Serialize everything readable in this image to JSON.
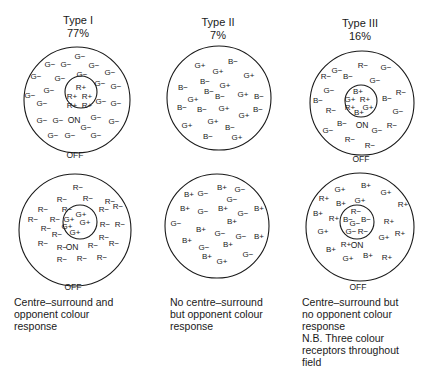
{
  "figure": {
    "columns": [
      {
        "id": "type1",
        "title": "Type I",
        "percent": "77%",
        "caption": "Centre–surround and\nopponent colour\nresponse",
        "top": {
          "outer": {
            "cx": 77,
            "cy": 100,
            "r": 53
          },
          "inner": {
            "cx": 81,
            "cy": 92,
            "r": 16
          },
          "off_label": {
            "text": "OFF",
            "x": 75,
            "y": 156
          },
          "on_label": {
            "text": "ON",
            "x": 74,
            "y": 121
          },
          "centre_labels": [
            {
              "t": "R+",
              "x": 81,
              "y": 88
            },
            {
              "t": "R+",
              "x": 72,
              "y": 97
            },
            {
              "t": "R+",
              "x": 87,
              "y": 97
            },
            {
              "t": "R+",
              "x": 72,
              "y": 106
            },
            {
              "t": "R+",
              "x": 87,
              "y": 106
            }
          ],
          "surround_labels": [
            {
              "t": "G−",
              "x": 80,
              "y": 57
            },
            {
              "t": "G−",
              "x": 50,
              "y": 65
            },
            {
              "t": "G−",
              "x": 66,
              "y": 65
            },
            {
              "t": "G−",
              "x": 94,
              "y": 66
            },
            {
              "t": "G−",
              "x": 36,
              "y": 77
            },
            {
              "t": "G−",
              "x": 60,
              "y": 79
            },
            {
              "t": "G−",
              "x": 82,
              "y": 75
            },
            {
              "t": "G−",
              "x": 110,
              "y": 73
            },
            {
              "t": "G−",
              "x": 100,
              "y": 84
            },
            {
              "t": "G−",
              "x": 116,
              "y": 87
            },
            {
              "t": "G−",
              "x": 30,
              "y": 96
            },
            {
              "t": "G−",
              "x": 49,
              "y": 91
            },
            {
              "t": "G−",
              "x": 42,
              "y": 104
            },
            {
              "t": "G−",
              "x": 101,
              "y": 102
            },
            {
              "t": "G−",
              "x": 116,
              "y": 104
            },
            {
              "t": "G−",
              "x": 42,
              "y": 121
            },
            {
              "t": "G−",
              "x": 58,
              "y": 121
            },
            {
              "t": "G−",
              "x": 96,
              "y": 118
            },
            {
              "t": "G−",
              "x": 114,
              "y": 122
            },
            {
              "t": "G−",
              "x": 86,
              "y": 128
            },
            {
              "t": "G−",
              "x": 53,
              "y": 136
            },
            {
              "t": "G−",
              "x": 70,
              "y": 136
            },
            {
              "t": "G−",
              "x": 96,
              "y": 136
            }
          ]
        },
        "bottom": {
          "outer": {
            "cx": 75,
            "cy": 230,
            "r": 56
          },
          "inner": {
            "cx": 80,
            "cy": 222,
            "r": 17
          },
          "off_label": {
            "text": "OFF",
            "x": 73,
            "y": 288
          },
          "on_label": {
            "text": "ON",
            "x": 72,
            "y": 248
          },
          "centre_labels": [
            {
              "t": "G+",
              "x": 81,
              "y": 215
            },
            {
              "t": "G+",
              "x": 69,
              "y": 220
            },
            {
              "t": "G+",
              "x": 85,
              "y": 223
            },
            {
              "t": "G+",
              "x": 67,
              "y": 227
            },
            {
              "t": "G+",
              "x": 75,
              "y": 233
            }
          ],
          "surround_labels": [
            {
              "t": "R−",
              "x": 78,
              "y": 188
            },
            {
              "t": "R−",
              "x": 62,
              "y": 200
            },
            {
              "t": "R−",
              "x": 88,
              "y": 199
            },
            {
              "t": "R−",
              "x": 110,
              "y": 202
            },
            {
              "t": "R−",
              "x": 43,
              "y": 210
            },
            {
              "t": "R−",
              "x": 67,
              "y": 210
            },
            {
              "t": "R−",
              "x": 104,
              "y": 210
            },
            {
              "t": "R−",
              "x": 118,
              "y": 207
            },
            {
              "t": "R−",
              "x": 33,
              "y": 220
            },
            {
              "t": "R−",
              "x": 55,
              "y": 220
            },
            {
              "t": "R−",
              "x": 105,
              "y": 225
            },
            {
              "t": "R−",
              "x": 120,
              "y": 225
            },
            {
              "t": "R−",
              "x": 46,
              "y": 229
            },
            {
              "t": "R−",
              "x": 57,
              "y": 235
            },
            {
              "t": "R−",
              "x": 104,
              "y": 238
            },
            {
              "t": "R−",
              "x": 43,
              "y": 244
            },
            {
              "t": "R−",
              "x": 62,
              "y": 248
            },
            {
              "t": "R−",
              "x": 93,
              "y": 246
            },
            {
              "t": "R−",
              "x": 114,
              "y": 244
            },
            {
              "t": "R−",
              "x": 62,
              "y": 260
            },
            {
              "t": "R−",
              "x": 82,
              "y": 259
            },
            {
              "t": "R−",
              "x": 102,
              "y": 258
            }
          ]
        }
      },
      {
        "id": "type2",
        "title": "Type II",
        "percent": "7%",
        "caption": "No centre–surround\nbut opponent colour\nresponse",
        "top": {
          "outer": {
            "cx": 219,
            "cy": 98,
            "r": 52
          },
          "surround_labels": [
            {
              "t": "G+",
              "x": 200,
              "y": 66
            },
            {
              "t": "B−",
              "x": 233,
              "y": 62
            },
            {
              "t": "G+",
              "x": 218,
              "y": 72
            },
            {
              "t": "G+",
              "x": 249,
              "y": 76
            },
            {
              "t": "B−",
              "x": 205,
              "y": 82
            },
            {
              "t": "G+",
              "x": 225,
              "y": 86
            },
            {
              "t": "B−",
              "x": 183,
              "y": 88
            },
            {
              "t": "B−",
              "x": 209,
              "y": 92
            },
            {
              "t": "G+",
              "x": 193,
              "y": 100
            },
            {
              "t": "B−",
              "x": 220,
              "y": 97
            },
            {
              "t": "G+",
              "x": 243,
              "y": 95
            },
            {
              "t": "B−",
              "x": 259,
              "y": 97
            },
            {
              "t": "B−",
              "x": 182,
              "y": 108
            },
            {
              "t": "B−",
              "x": 202,
              "y": 110
            },
            {
              "t": "G+",
              "x": 224,
              "y": 109
            },
            {
              "t": "B−",
              "x": 258,
              "y": 110
            },
            {
              "t": "G+",
              "x": 244,
              "y": 116
            },
            {
              "t": "G+",
              "x": 213,
              "y": 122
            },
            {
              "t": "G+",
              "x": 187,
              "y": 126
            },
            {
              "t": "B−",
              "x": 230,
              "y": 128
            },
            {
              "t": "B−",
              "x": 208,
              "y": 137
            },
            {
              "t": "G+",
              "x": 237,
              "y": 138
            }
          ]
        },
        "bottom": {
          "outer": {
            "cx": 217,
            "cy": 226,
            "r": 52
          },
          "surround_labels": [
            {
              "t": "B+",
              "x": 222,
              "y": 188
            },
            {
              "t": "G−",
              "x": 240,
              "y": 190
            },
            {
              "t": "B+",
              "x": 189,
              "y": 195
            },
            {
              "t": "G−",
              "x": 203,
              "y": 194
            },
            {
              "t": "G−",
              "x": 232,
              "y": 200
            },
            {
              "t": "B+",
              "x": 185,
              "y": 209
            },
            {
              "t": "G−",
              "x": 203,
              "y": 212
            },
            {
              "t": "B+",
              "x": 223,
              "y": 209
            },
            {
              "t": "G−",
              "x": 243,
              "y": 214
            },
            {
              "t": "B+",
              "x": 259,
              "y": 209
            },
            {
              "t": "G−",
              "x": 176,
              "y": 224
            },
            {
              "t": "B+",
              "x": 232,
              "y": 222
            },
            {
              "t": "B+",
              "x": 201,
              "y": 230
            },
            {
              "t": "G−",
              "x": 220,
              "y": 234
            },
            {
              "t": "G−",
              "x": 241,
              "y": 237
            },
            {
              "t": "B+",
              "x": 259,
              "y": 237
            },
            {
              "t": "B+",
              "x": 187,
              "y": 241
            },
            {
              "t": "G−",
              "x": 204,
              "y": 248
            },
            {
              "t": "B+",
              "x": 228,
              "y": 245
            },
            {
              "t": "G−",
              "x": 248,
              "y": 255
            },
            {
              "t": "B+",
              "x": 207,
              "y": 257
            },
            {
              "t": "G+",
              "x": 222,
              "y": 262
            }
          ]
        }
      },
      {
        "id": "type3",
        "title": "Type III",
        "percent": "16%",
        "caption": "Centre–surround but\nno opponent colour\nresponse\nN.B. Three colour\nreceptors throughout\nfield",
        "top": {
          "outer": {
            "cx": 362,
            "cy": 103,
            "r": 52
          },
          "inner": {
            "cx": 361,
            "cy": 101,
            "r": 16
          },
          "off_label": {
            "text": "OFF",
            "x": 361,
            "y": 160
          },
          "on_label": {
            "text": "ON",
            "x": 362,
            "y": 126
          },
          "centre_labels": [
            {
              "t": "B+",
              "x": 358,
              "y": 92
            },
            {
              "t": "G+",
              "x": 350,
              "y": 100
            },
            {
              "t": "R+",
              "x": 365,
              "y": 100
            },
            {
              "t": "R+",
              "x": 350,
              "y": 108
            },
            {
              "t": "G+",
              "x": 368,
              "y": 108
            },
            {
              "t": "B+",
              "x": 359,
              "y": 113
            }
          ],
          "surround_labels": [
            {
              "t": "G−",
              "x": 337,
              "y": 71
            },
            {
              "t": "R−",
              "x": 363,
              "y": 66
            },
            {
              "t": "G−",
              "x": 386,
              "y": 68
            },
            {
              "t": "R−",
              "x": 326,
              "y": 77
            },
            {
              "t": "B−",
              "x": 348,
              "y": 77
            },
            {
              "t": "G−",
              "x": 375,
              "y": 81
            },
            {
              "t": "G−",
              "x": 329,
              "y": 91
            },
            {
              "t": "R−",
              "x": 401,
              "y": 93
            },
            {
              "t": "B−",
              "x": 318,
              "y": 101
            },
            {
              "t": "B−",
              "x": 387,
              "y": 99
            },
            {
              "t": "R−",
              "x": 331,
              "y": 111
            },
            {
              "t": "G−",
              "x": 398,
              "y": 112
            },
            {
              "t": "B−",
              "x": 342,
              "y": 124
            },
            {
              "t": "G−",
              "x": 328,
              "y": 131
            },
            {
              "t": "G−",
              "x": 377,
              "y": 131
            },
            {
              "t": "R−",
              "x": 392,
              "y": 126
            },
            {
              "t": "R−",
              "x": 350,
              "y": 140
            },
            {
              "t": "R−",
              "x": 370,
              "y": 146
            }
          ]
        },
        "bottom": {
          "outer": {
            "cx": 360,
            "cy": 227,
            "r": 54
          },
          "inner": {
            "cx": 357,
            "cy": 222,
            "r": 17
          },
          "off_label": {
            "text": "OFF",
            "x": 358,
            "y": 288
          },
          "on_label": {
            "text": "ON",
            "x": 357,
            "y": 246
          },
          "centre_labels": [
            {
              "t": "R−",
              "x": 356,
              "y": 212
            },
            {
              "t": "B−",
              "x": 348,
              "y": 220
            },
            {
              "t": "B−",
              "x": 366,
              "y": 220
            },
            {
              "t": "G−",
              "x": 355,
              "y": 224
            },
            {
              "t": "G−",
              "x": 351,
              "y": 232
            },
            {
              "t": "R−",
              "x": 363,
              "y": 232
            }
          ],
          "surround_labels": [
            {
              "t": "G+",
              "x": 340,
              "y": 190
            },
            {
              "t": "B+",
              "x": 366,
              "y": 186
            },
            {
              "t": "G+",
              "x": 386,
              "y": 193
            },
            {
              "t": "R+",
              "x": 324,
              "y": 199
            },
            {
              "t": "B+",
              "x": 341,
              "y": 204
            },
            {
              "t": "G+",
              "x": 360,
              "y": 201
            },
            {
              "t": "R+",
              "x": 403,
              "y": 205
            },
            {
              "t": "B+",
              "x": 318,
              "y": 214
            },
            {
              "t": "R+",
              "x": 334,
              "y": 219
            },
            {
              "t": "R+",
              "x": 389,
              "y": 222
            },
            {
              "t": "G+",
              "x": 323,
              "y": 232
            },
            {
              "t": "G+",
              "x": 384,
              "y": 238
            },
            {
              "t": "R+",
              "x": 400,
              "y": 234
            },
            {
              "t": "R+",
              "x": 346,
              "y": 245
            },
            {
              "t": "B+",
              "x": 331,
              "y": 250
            },
            {
              "t": "G+",
              "x": 348,
              "y": 259
            },
            {
              "t": "B+",
              "x": 368,
              "y": 256
            },
            {
              "t": "R+",
              "x": 387,
              "y": 258
            }
          ]
        }
      }
    ]
  },
  "headings": {
    "type1_title": "Type I",
    "type1_percent": "77%",
    "type2_title": "Type II",
    "type2_percent": "7%",
    "type3_title": "Type III",
    "type3_percent": "16%"
  },
  "captions": {
    "type1": "Centre–surround and\nopponent colour\nresponse",
    "type2": "No centre–surround\nbut opponent colour\nresponse",
    "type3": "Centre–surround but\nno opponent colour\nresponse\nN.B. Three colour\nreceptors throughout\nfield"
  },
  "colors": {
    "ink": "#1a1a1a",
    "background": "#ffffff"
  }
}
